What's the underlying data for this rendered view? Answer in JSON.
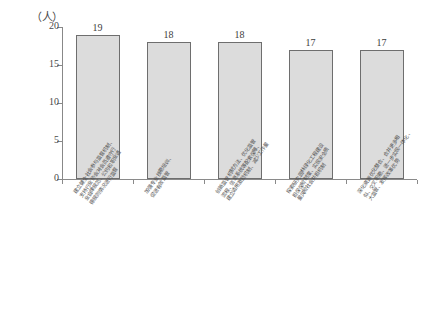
{
  "chart_data": {
    "type": "bar",
    "title": "",
    "xlabel": "",
    "ylabel": "（人）",
    "unit_label": "（人）",
    "ylim": [
      0,
      20
    ],
    "yticks": [
      0,
      5,
      10,
      15,
      20
    ],
    "ytick_labels": [
      "0",
      "5",
      "10",
      "15",
      "20"
    ],
    "grid": false,
    "legend": false,
    "categories": [
      "建立健全社会参与监督机制、支持行业协会对会员遵守行业自律规范、公约和职业道德规则情况进行监督",
      "加强专业技能培训、促进有效监管",
      "创新监管机制方法、优化监管流程、信息系统等配套保障、建立适用激励机制、减少工作量",
      "探索研究园林绿化工程建设担保保险制度、实现安全质量风险社会共担机制",
      "深化资源优化整合、合并更多相似、交叉职能、进一步实现一体化、大监管、发挥改革优势"
    ],
    "category_lines": [
      [
        "建立健全社会参与监督机制、",
        "支持行业协会对会员遵守行",
        "业自律规范、公约和职业道",
        "德规则情况进行监督"
      ],
      [
        "加强专业技能培训、",
        "促进有效监管"
      ],
      [
        "创新监管机制方法、优化监管",
        "流程、信息系统等配套保障、",
        "建立适用激励机制、减少工作量"
      ],
      [
        "探索研究园林绿化工程建设",
        "担保保险制度、实现安全质",
        "量风险社会共担机制"
      ],
      [
        "深化资源优化整合、合并更多相",
        "似、交叉职能、进一步实现一体化、",
        "大监管、发挥改革优势"
      ]
    ],
    "values": [
      19,
      18,
      18,
      17,
      17
    ],
    "value_labels": [
      "19",
      "18",
      "18",
      "17",
      "17"
    ],
    "colors": {
      "bar_fill": "#dcdcdc",
      "bar_border": "#6e6e6e",
      "axis": "#8a8a8a",
      "text": "#4a4a4a"
    }
  }
}
